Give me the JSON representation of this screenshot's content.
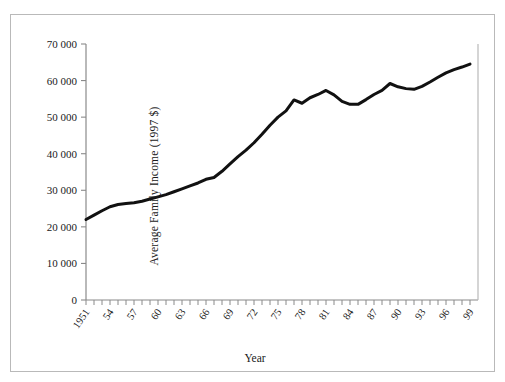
{
  "figure": {
    "cropped_heading": "",
    "xlabel": "Year",
    "ylabel": "Average Family Income (1997 $)"
  },
  "chart_data": {
    "type": "line",
    "title": "",
    "xlabel": "Year",
    "ylabel": "Average Family Income (1997 $)",
    "xlim": [
      1951,
      2000
    ],
    "ylim": [
      0,
      70000
    ],
    "grid": false,
    "legend": false,
    "line_color": "#111111",
    "line_width": 3,
    "ytick_values": [
      0,
      10000,
      20000,
      30000,
      40000,
      50000,
      60000,
      70000
    ],
    "ytick_labels": [
      "0",
      "10 000",
      "20 000",
      "30 000",
      "40 000",
      "50 000",
      "60 000",
      "70 000"
    ],
    "xtick_labels": [
      "1951",
      "54",
      "57",
      "60",
      "63",
      "66",
      "69",
      "72",
      "75",
      "78",
      "81",
      "84",
      "87",
      "90",
      "93",
      "96",
      "99"
    ],
    "xtick_label_years": [
      1951,
      1954,
      1957,
      1960,
      1963,
      1966,
      1969,
      1972,
      1975,
      1978,
      1981,
      1984,
      1987,
      1990,
      1993,
      1996,
      1999
    ],
    "minor_tick_interval": 1,
    "x": [
      1951,
      1952,
      1953,
      1954,
      1955,
      1956,
      1957,
      1958,
      1959,
      1960,
      1961,
      1962,
      1963,
      1964,
      1965,
      1966,
      1967,
      1968,
      1969,
      1970,
      1971,
      1972,
      1973,
      1974,
      1975,
      1976,
      1977,
      1978,
      1979,
      1980,
      1981,
      1982,
      1983,
      1984,
      1985,
      1986,
      1987,
      1988,
      1989,
      1990,
      1991,
      1992,
      1993,
      1994,
      1995,
      1996,
      1997,
      1998,
      1999
    ],
    "values": [
      22000,
      23200,
      24400,
      25500,
      26100,
      26400,
      26600,
      27000,
      27600,
      28200,
      28800,
      29600,
      30400,
      31200,
      32000,
      33000,
      33500,
      35200,
      37200,
      39200,
      41000,
      43000,
      45300,
      47800,
      50000,
      51700,
      54700,
      53800,
      55300,
      56200,
      57300,
      56100,
      54300,
      53500,
      53500,
      54800,
      56200,
      57300,
      59200,
      58300,
      57800,
      57600,
      58400,
      59600,
      60900,
      62100,
      63000,
      63700,
      64500
    ]
  }
}
